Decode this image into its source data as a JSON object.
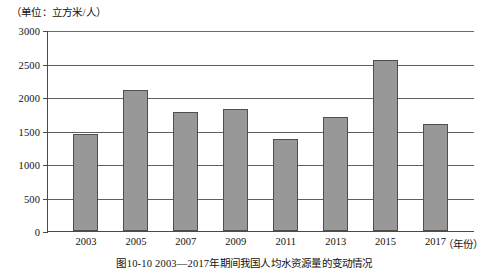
{
  "figure": {
    "unit_label": "（单位：立方米/人）",
    "caption": "图10-10  2003—2017年期间我国人均水资源量的变动情况",
    "x_axis_title": "（年份）"
  },
  "chart_data": {
    "type": "bar",
    "title": "图10-10  2003—2017年期间我国人均水资源量的变动情况",
    "xlabel": "（年份）",
    "ylabel": "（单位：立方米/人）",
    "categories": [
      "2003",
      "2005",
      "2007",
      "2009",
      "2011",
      "2013",
      "2015",
      "2017"
    ],
    "values": [
      1450,
      2100,
      1780,
      1820,
      1380,
      1700,
      2550,
      1600
    ],
    "ylim": [
      0,
      3000
    ],
    "yticks": [
      0,
      500,
      1000,
      1500,
      2000,
      2500,
      3000
    ],
    "ytick_labels": [
      "0",
      "500",
      "1000",
      "1500",
      "2000",
      "2500",
      "3000"
    ],
    "grid": true,
    "legend": false,
    "bar_color": "#989898",
    "bar_edge_color": "#4f4f4f",
    "grid_color": "#5e5e5e",
    "axis_color": "#4a4a4a"
  }
}
